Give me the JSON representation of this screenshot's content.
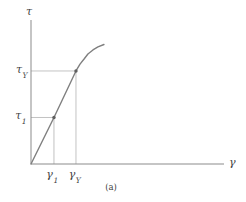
{
  "figure": {
    "caption": "(a)",
    "axis_labels": {
      "y": {
        "base": "τ",
        "sub": ""
      },
      "x": {
        "base": "γ",
        "sub": ""
      }
    },
    "point_labels": {
      "tau_Y": {
        "base": "τ",
        "sub": "Y"
      },
      "tau_1": {
        "base": "τ",
        "sub": "1"
      },
      "gamma_1": {
        "base": "γ",
        "sub": "1"
      },
      "gamma_Y": {
        "base": "γ",
        "sub": "Y"
      }
    },
    "colors": {
      "axis": "#8b8b8b",
      "curve": "#7f7f7f",
      "guide": "#b2b2b2",
      "marker": "#5f5f5f",
      "text": "#3f3f3f",
      "background": "#ffffff"
    }
  },
  "chart_data": {
    "type": "line",
    "title": "",
    "xlabel": "γ",
    "ylabel": "τ",
    "axes_numeric": false,
    "grid": false,
    "legend": "none",
    "xlim": [
      0,
      1
    ],
    "ylim": [
      0,
      1
    ],
    "series": [
      {
        "name": "shear stress-strain curve",
        "points": [
          [
            0.0,
            0.0
          ],
          [
            0.119,
            0.323
          ],
          [
            0.233,
            0.646
          ],
          [
            0.254,
            0.694
          ],
          [
            0.275,
            0.729
          ],
          [
            0.295,
            0.764
          ],
          [
            0.321,
            0.792
          ],
          [
            0.347,
            0.813
          ],
          [
            0.378,
            0.83
          ]
        ]
      }
    ],
    "marked_points": [
      {
        "x": 0.119,
        "y": 0.323,
        "x_label": "γ1",
        "y_label": "τ1"
      },
      {
        "x": 0.233,
        "y": 0.646,
        "x_label": "γY",
        "y_label": "τY"
      }
    ]
  }
}
